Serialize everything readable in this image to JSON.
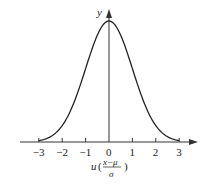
{
  "chart_data": {
    "type": "line",
    "title": "",
    "xlabel": "u (x−μ)/σ",
    "xlabel_parts": {
      "var": "u",
      "numerator": "x−μ",
      "denominator": "σ"
    },
    "ylabel": "y",
    "x_ticks": [
      "-3",
      "-2",
      "-1",
      "0",
      "1",
      "2",
      "3"
    ],
    "xlim": [
      -3,
      3
    ],
    "grid": false,
    "legend": null,
    "series": [
      {
        "name": "standard normal density",
        "x": [
          -3,
          -2.5,
          -2,
          -1.5,
          -1,
          -0.5,
          0,
          0.5,
          1,
          1.5,
          2,
          2.5,
          3
        ],
        "values": [
          0.004,
          0.018,
          0.054,
          0.13,
          0.242,
          0.352,
          0.399,
          0.352,
          0.242,
          0.13,
          0.054,
          0.018,
          0.004
        ]
      }
    ]
  }
}
